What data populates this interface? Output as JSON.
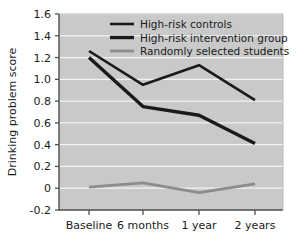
{
  "chart_data": {
    "type": "line",
    "title": "",
    "xlabel": "",
    "ylabel": "Drinking problem score",
    "categories": [
      "Baseline",
      "6 months",
      "1 year",
      "2 years"
    ],
    "ylim": [
      -0.2,
      1.6
    ],
    "yticks": [
      -0.2,
      0,
      0.2,
      0.4,
      0.6,
      0.8,
      1.0,
      1.2,
      1.4,
      1.6
    ],
    "ytick_labels": [
      "-0.2",
      "0",
      "0.2",
      "0.4",
      "0.6",
      "0.8",
      "1.0",
      "1.2",
      "1.4",
      "1.6"
    ],
    "grid": "horizontal-white-on-gray",
    "legend_position": "top-center",
    "plot_background": "#c9c9c9",
    "gridline_color": "#f2f2f2",
    "series": [
      {
        "name": "High-risk controls",
        "color": "#1a1a1a",
        "width": 2.6,
        "values": [
          1.26,
          0.95,
          1.13,
          0.81
        ]
      },
      {
        "name": "High-risk intervention group",
        "color": "#1a1a1a",
        "width": 3.4,
        "values": [
          1.2,
          0.75,
          0.67,
          0.41
        ]
      },
      {
        "name": "Randomly selected students",
        "color": "#8c8c8c",
        "width": 2.8,
        "values": [
          0.01,
          0.05,
          -0.04,
          0.04
        ]
      }
    ]
  },
  "axis": {
    "y_title": "Drinking problem score",
    "y_labels": [
      "1.6",
      "1.4",
      "1.2",
      "1.0",
      "0.8",
      "0.6",
      "0.4",
      "0.2",
      "0",
      "-0.2"
    ],
    "x_labels": [
      "Baseline",
      "6 months",
      "1 year",
      "2 years"
    ]
  },
  "legend": {
    "items": [
      {
        "label": "High-risk controls",
        "color": "#1a1a1a"
      },
      {
        "label": "High-risk intervention group",
        "color": "#1a1a1a"
      },
      {
        "label": "Randomly selected students",
        "color": "#8c8c8c"
      }
    ]
  },
  "colors": {
    "plot_bg": "#c9c9c9",
    "grid": "#f2f2f2",
    "axis": "#4d4d4d",
    "text": "#1a1a1a",
    "series_dark": "#1a1a1a",
    "series_gray": "#8c8c8c"
  }
}
